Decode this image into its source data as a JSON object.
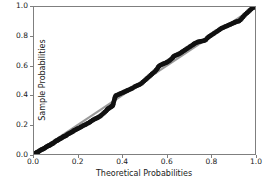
{
  "chart_data": {
    "type": "scatter",
    "title": "",
    "xlabel": "Theoretical Probabilities",
    "ylabel": "Sample Probabilities",
    "xlim": [
      0.0,
      1.0
    ],
    "ylim": [
      0.0,
      1.0
    ],
    "grid": false,
    "legend": null,
    "xticks": [
      "0.0",
      "0.2",
      "0.4",
      "0.6",
      "0.8",
      "1.0"
    ],
    "xtick_values": [
      0.0,
      0.2,
      0.4,
      0.6,
      0.8,
      1.0
    ],
    "yticks": [
      "0.0",
      "0.2",
      "0.4",
      "0.6",
      "0.8",
      "1.0"
    ],
    "ytick_values": [
      0.0,
      0.2,
      0.4,
      0.6,
      0.8,
      1.0
    ],
    "marker_color": "#111111",
    "reference_line_color": "#9a9a9a",
    "axes_color": "#7f7f7f",
    "series": [
      {
        "name": "Sample vs Theoretical Probabilities",
        "marker": "o",
        "points": [
          [
            0.006,
            0.004
          ],
          [
            0.01,
            0.008
          ],
          [
            0.014,
            0.012
          ],
          [
            0.018,
            0.014
          ],
          [
            0.022,
            0.018
          ],
          [
            0.026,
            0.022
          ],
          [
            0.03,
            0.026
          ],
          [
            0.034,
            0.03
          ],
          [
            0.038,
            0.032
          ],
          [
            0.042,
            0.034
          ],
          [
            0.046,
            0.038
          ],
          [
            0.05,
            0.042
          ],
          [
            0.054,
            0.046
          ],
          [
            0.058,
            0.05
          ],
          [
            0.062,
            0.054
          ],
          [
            0.066,
            0.056
          ],
          [
            0.07,
            0.058
          ],
          [
            0.074,
            0.062
          ],
          [
            0.078,
            0.066
          ],
          [
            0.082,
            0.07
          ],
          [
            0.086,
            0.072
          ],
          [
            0.09,
            0.076
          ],
          [
            0.094,
            0.082
          ],
          [
            0.098,
            0.086
          ],
          [
            0.102,
            0.09
          ],
          [
            0.106,
            0.092
          ],
          [
            0.11,
            0.096
          ],
          [
            0.114,
            0.1
          ],
          [
            0.118,
            0.104
          ],
          [
            0.122,
            0.106
          ],
          [
            0.126,
            0.11
          ],
          [
            0.13,
            0.114
          ],
          [
            0.134,
            0.118
          ],
          [
            0.138,
            0.122
          ],
          [
            0.142,
            0.122
          ],
          [
            0.146,
            0.126
          ],
          [
            0.15,
            0.132
          ],
          [
            0.155,
            0.136
          ],
          [
            0.16,
            0.14
          ],
          [
            0.165,
            0.144
          ],
          [
            0.17,
            0.148
          ],
          [
            0.175,
            0.152
          ],
          [
            0.18,
            0.158
          ],
          [
            0.185,
            0.162
          ],
          [
            0.19,
            0.166
          ],
          [
            0.195,
            0.17
          ],
          [
            0.2,
            0.174
          ],
          [
            0.206,
            0.178
          ],
          [
            0.212,
            0.184
          ],
          [
            0.218,
            0.188
          ],
          [
            0.224,
            0.194
          ],
          [
            0.23,
            0.198
          ],
          [
            0.236,
            0.202
          ],
          [
            0.242,
            0.208
          ],
          [
            0.248,
            0.212
          ],
          [
            0.254,
            0.218
          ],
          [
            0.26,
            0.224
          ],
          [
            0.266,
            0.23
          ],
          [
            0.272,
            0.236
          ],
          [
            0.278,
            0.24
          ],
          [
            0.284,
            0.244
          ],
          [
            0.29,
            0.248
          ],
          [
            0.296,
            0.254
          ],
          [
            0.302,
            0.26
          ],
          [
            0.308,
            0.268
          ],
          [
            0.314,
            0.276
          ],
          [
            0.32,
            0.284
          ],
          [
            0.326,
            0.292
          ],
          [
            0.33,
            0.3
          ],
          [
            0.334,
            0.306
          ],
          [
            0.338,
            0.31
          ],
          [
            0.342,
            0.314
          ],
          [
            0.346,
            0.318
          ],
          [
            0.35,
            0.322
          ],
          [
            0.354,
            0.326
          ],
          [
            0.356,
            0.33
          ],
          [
            0.358,
            0.336
          ],
          [
            0.36,
            0.348
          ],
          [
            0.362,
            0.36
          ],
          [
            0.364,
            0.372
          ],
          [
            0.366,
            0.382
          ],
          [
            0.368,
            0.392
          ],
          [
            0.372,
            0.398
          ],
          [
            0.378,
            0.402
          ],
          [
            0.384,
            0.406
          ],
          [
            0.39,
            0.41
          ],
          [
            0.396,
            0.414
          ],
          [
            0.402,
            0.418
          ],
          [
            0.408,
            0.422
          ],
          [
            0.414,
            0.426
          ],
          [
            0.42,
            0.43
          ],
          [
            0.426,
            0.434
          ],
          [
            0.432,
            0.438
          ],
          [
            0.438,
            0.442
          ],
          [
            0.444,
            0.446
          ],
          [
            0.45,
            0.452
          ],
          [
            0.456,
            0.458
          ],
          [
            0.462,
            0.462
          ],
          [
            0.468,
            0.466
          ],
          [
            0.474,
            0.47
          ],
          [
            0.48,
            0.474
          ],
          [
            0.486,
            0.48
          ],
          [
            0.492,
            0.488
          ],
          [
            0.498,
            0.496
          ],
          [
            0.504,
            0.504
          ],
          [
            0.51,
            0.512
          ],
          [
            0.516,
            0.52
          ],
          [
            0.522,
            0.528
          ],
          [
            0.528,
            0.536
          ],
          [
            0.534,
            0.544
          ],
          [
            0.54,
            0.552
          ],
          [
            0.546,
            0.56
          ],
          [
            0.552,
            0.57
          ],
          [
            0.558,
            0.58
          ],
          [
            0.562,
            0.59
          ],
          [
            0.566,
            0.598
          ],
          [
            0.572,
            0.604
          ],
          [
            0.578,
            0.608
          ],
          [
            0.584,
            0.612
          ],
          [
            0.59,
            0.616
          ],
          [
            0.596,
            0.62
          ],
          [
            0.602,
            0.624
          ],
          [
            0.608,
            0.63
          ],
          [
            0.614,
            0.636
          ],
          [
            0.62,
            0.644
          ],
          [
            0.626,
            0.652
          ],
          [
            0.63,
            0.66
          ],
          [
            0.634,
            0.666
          ],
          [
            0.64,
            0.67
          ],
          [
            0.646,
            0.674
          ],
          [
            0.652,
            0.678
          ],
          [
            0.658,
            0.682
          ],
          [
            0.664,
            0.688
          ],
          [
            0.67,
            0.694
          ],
          [
            0.676,
            0.7
          ],
          [
            0.682,
            0.706
          ],
          [
            0.688,
            0.712
          ],
          [
            0.694,
            0.718
          ],
          [
            0.7,
            0.724
          ],
          [
            0.706,
            0.73
          ],
          [
            0.712,
            0.736
          ],
          [
            0.718,
            0.742
          ],
          [
            0.724,
            0.748
          ],
          [
            0.73,
            0.754
          ],
          [
            0.736,
            0.758
          ],
          [
            0.742,
            0.762
          ],
          [
            0.748,
            0.764
          ],
          [
            0.754,
            0.766
          ],
          [
            0.76,
            0.768
          ],
          [
            0.766,
            0.77
          ],
          [
            0.772,
            0.772
          ],
          [
            0.778,
            0.778
          ],
          [
            0.784,
            0.788
          ],
          [
            0.79,
            0.796
          ],
          [
            0.796,
            0.802
          ],
          [
            0.802,
            0.808
          ],
          [
            0.808,
            0.814
          ],
          [
            0.814,
            0.82
          ],
          [
            0.82,
            0.826
          ],
          [
            0.826,
            0.832
          ],
          [
            0.832,
            0.838
          ],
          [
            0.838,
            0.844
          ],
          [
            0.844,
            0.85
          ],
          [
            0.85,
            0.856
          ],
          [
            0.856,
            0.86
          ],
          [
            0.862,
            0.864
          ],
          [
            0.868,
            0.868
          ],
          [
            0.874,
            0.872
          ],
          [
            0.88,
            0.876
          ],
          [
            0.886,
            0.88
          ],
          [
            0.892,
            0.884
          ],
          [
            0.898,
            0.888
          ],
          [
            0.904,
            0.892
          ],
          [
            0.91,
            0.896
          ],
          [
            0.916,
            0.9
          ],
          [
            0.922,
            0.902
          ],
          [
            0.928,
            0.904
          ],
          [
            0.934,
            0.912
          ],
          [
            0.94,
            0.922
          ],
          [
            0.946,
            0.932
          ],
          [
            0.952,
            0.942
          ],
          [
            0.958,
            0.952
          ],
          [
            0.964,
            0.96
          ],
          [
            0.97,
            0.968
          ],
          [
            0.976,
            0.976
          ],
          [
            0.982,
            0.984
          ],
          [
            0.988,
            0.992
          ],
          [
            0.994,
            0.998
          ]
        ]
      }
    ],
    "reference_line": {
      "name": "45-degree reference line",
      "x": [
        0.0,
        1.0
      ],
      "y": [
        0.0,
        1.0
      ]
    }
  }
}
